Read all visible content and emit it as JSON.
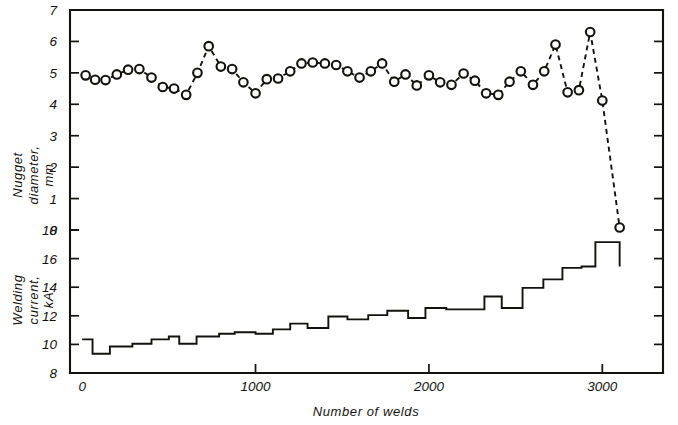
{
  "chart_data": {
    "type": "line",
    "title": "",
    "subtitle": "",
    "xlabel": "Number of welds",
    "xlim": [
      -70,
      3350
    ],
    "xticks": [
      0,
      1000,
      2000,
      3000
    ],
    "xticklabels": [
      "0",
      "1000",
      "2000",
      "3000"
    ],
    "grid": false,
    "legend_position": "none",
    "panels": [
      {
        "name": "nugget-diameter-panel",
        "ylabel": "Nugget diameter, mm",
        "ylabel_lines": [
          "Nugget",
          "diameter,",
          "mm"
        ],
        "ylim": [
          0,
          7
        ],
        "yticks": [
          0,
          1,
          2,
          3,
          4,
          5,
          6,
          7
        ],
        "yticklabels": [
          "0",
          "1",
          "2",
          "3",
          "4",
          "5",
          "6",
          "7"
        ],
        "series": [
          {
            "name": "Nugget diameter",
            "marker": "open-circle",
            "linestyle": "dashed",
            "x": [
              20,
              75,
              135,
              200,
              265,
              330,
              400,
              465,
              530,
              600,
              665,
              730,
              800,
              865,
              930,
              1000,
              1065,
              1130,
              1200,
              1265,
              1330,
              1400,
              1465,
              1530,
              1600,
              1665,
              1730,
              1800,
              1865,
              1930,
              2000,
              2065,
              2130,
              2200,
              2265,
              2330,
              2400,
              2465,
              2530,
              2600,
              2665,
              2730,
              2800,
              2865,
              2930,
              3000,
              3100
            ],
            "y": [
              4.92,
              4.78,
              4.77,
              4.95,
              5.1,
              5.12,
              4.85,
              4.55,
              4.5,
              4.3,
              5.0,
              5.85,
              5.2,
              5.12,
              4.7,
              4.35,
              4.8,
              4.82,
              5.05,
              5.3,
              5.33,
              5.3,
              5.25,
              5.05,
              4.85,
              5.05,
              5.3,
              4.72,
              4.95,
              4.6,
              4.92,
              4.7,
              4.62,
              4.98,
              4.75,
              4.35,
              4.3,
              4.72,
              5.05,
              4.62,
              5.05,
              5.9,
              4.38,
              4.45,
              6.3,
              4.12,
              0.08
            ]
          }
        ]
      },
      {
        "name": "welding-current-panel",
        "ylabel": "Welding current, kA",
        "ylabel_lines": [
          "Welding",
          "current,",
          "kA"
        ],
        "ylim": [
          8,
          18
        ],
        "yticks": [
          8,
          10,
          12,
          14,
          16,
          18
        ],
        "yticklabels": [
          "8",
          "10",
          "12",
          "14",
          "16",
          "18"
        ],
        "series": [
          {
            "name": "Welding current",
            "marker": "none",
            "linestyle": "solid-step",
            "step_edges": [
              0,
              60,
              160,
              290,
              400,
              500,
              560,
              660,
              790,
              880,
              1000,
              1100,
              1200,
              1300,
              1420,
              1530,
              1650,
              1760,
              1880,
              1980,
              2100,
              2200,
              2320,
              2420,
              2540,
              2660,
              2770,
              2880,
              2960,
              3100
            ],
            "step_values": [
              10.35,
              9.35,
              9.85,
              10.05,
              10.35,
              10.55,
              10.05,
              10.55,
              10.75,
              10.85,
              10.75,
              11.05,
              11.45,
              11.15,
              11.95,
              11.75,
              12.05,
              12.35,
              11.85,
              12.55,
              12.45,
              12.45,
              13.35,
              12.55,
              13.95,
              14.55,
              15.35,
              15.45,
              17.15,
              15.45
            ]
          }
        ]
      }
    ]
  },
  "axes": {
    "x_axis_title": "Number of welds",
    "nugget_axis_lines": [
      "Nugget",
      "diameter,",
      "mm"
    ],
    "current_axis_lines": [
      "Welding",
      "current,",
      "kA"
    ],
    "nugget_tick_labels": [
      "7",
      "6",
      "5",
      "4",
      "3",
      "2",
      "1",
      "0"
    ],
    "current_tick_labels": [
      "18",
      "16",
      "14",
      "12",
      "10",
      "8"
    ],
    "x_tick_labels": [
      "0",
      "1000",
      "2000",
      "3000"
    ]
  },
  "style": {
    "ink_color": "#14120f",
    "paper_color": "#ffffff"
  }
}
